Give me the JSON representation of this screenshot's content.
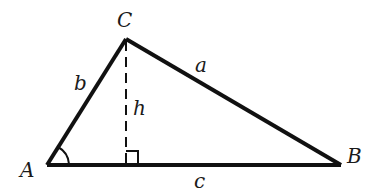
{
  "diagram": {
    "vertices": {
      "A": {
        "label": "A",
        "x": 47,
        "y": 165
      },
      "B": {
        "label": "B",
        "x": 341,
        "y": 165
      },
      "C": {
        "label": "C",
        "x": 126,
        "y": 39
      }
    },
    "sides": {
      "a": {
        "label": "a",
        "from": "C",
        "to": "B"
      },
      "b": {
        "label": "b",
        "from": "A",
        "to": "C"
      },
      "c": {
        "label": "c",
        "from": "A",
        "to": "B"
      }
    },
    "altitude": {
      "label": "h",
      "from": "C",
      "foot_x": 126,
      "style": "dashed"
    },
    "markers": {
      "angle_A": "arc",
      "right_angle_at_foot": "square"
    },
    "colors": {
      "stroke": "#111111",
      "background": "#ffffff"
    }
  }
}
